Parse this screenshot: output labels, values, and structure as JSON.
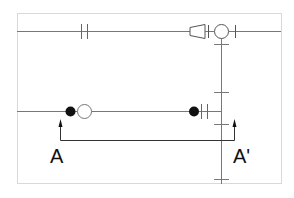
{
  "diagram": {
    "type": "piping-schematic",
    "colors": {
      "border": "#d9d9d9",
      "pipe": "#777777",
      "symbol": "#555555",
      "fill": "#111111",
      "text": "#111111"
    },
    "section": {
      "start_label": "A",
      "end_label": "A'"
    },
    "symbols": [
      {
        "name": "union",
        "line": "top"
      },
      {
        "name": "reducer",
        "line": "top"
      },
      {
        "name": "valve-circle",
        "line": "top"
      },
      {
        "name": "filled-dot",
        "line": "lower"
      },
      {
        "name": "open-circle",
        "line": "lower"
      },
      {
        "name": "filled-dot",
        "line": "lower"
      },
      {
        "name": "union",
        "line": "lower"
      }
    ]
  }
}
